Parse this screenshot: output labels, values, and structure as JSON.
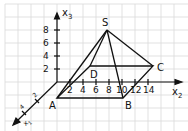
{
  "diagram": {
    "type": "3d-coordinate-pyramid",
    "axes": {
      "x1": {
        "label": "x",
        "subscript": "1",
        "ticks": [
          "2",
          "4"
        ]
      },
      "x2": {
        "label": "x",
        "subscript": "2",
        "ticks": [
          "2",
          "4",
          "6",
          "8",
          "10",
          "12",
          "14"
        ]
      },
      "x3": {
        "label": "x",
        "subscript": "3",
        "ticks": [
          "2",
          "4",
          "6",
          "8"
        ]
      }
    },
    "points": {
      "S": "S",
      "A": "A",
      "B": "B",
      "C": "C",
      "D": "D"
    },
    "colors": {
      "grid": "#d6d6d6",
      "lines": "#111111",
      "background": "#ffffff"
    }
  }
}
